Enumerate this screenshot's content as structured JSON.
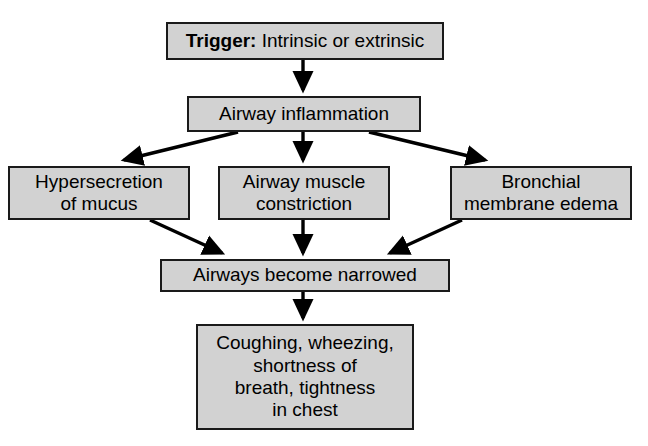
{
  "diagram": {
    "type": "flowchart",
    "background_color": "#ffffff",
    "node_fill_color": "#d2d2d2",
    "node_border_color": "#1a1a1a",
    "arrow_color": "#000000",
    "nodes": {
      "trigger": {
        "lead": "Trigger:",
        "text": " Intrinsic or extrinsic"
      },
      "inflammation": {
        "text": "Airway inflammation"
      },
      "mucus": {
        "text": "Hypersecretion\nof mucus"
      },
      "muscle": {
        "text": "Airway muscle\nconstriction"
      },
      "edema": {
        "text": "Bronchial\nmembrane edema"
      },
      "narrowed": {
        "text": "Airways become narrowed"
      },
      "symptoms": {
        "text": "Coughing, wheezing,\nshortness of\nbreath, tightness\nin chest"
      }
    }
  }
}
